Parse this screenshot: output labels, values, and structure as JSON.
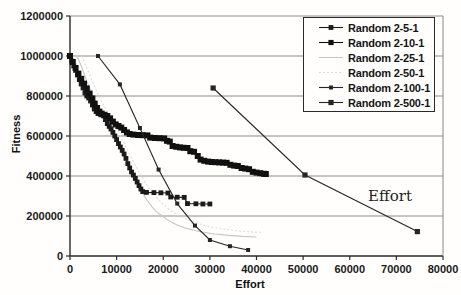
{
  "chart_data": {
    "type": "line",
    "title": "",
    "x_axis": {
      "title": "Effort",
      "min": 0,
      "max": 80000,
      "tick_values": [
        0,
        10000,
        20000,
        30000,
        40000,
        50000,
        60000,
        70000,
        80000
      ],
      "tick_labels": [
        "0",
        "10000",
        "20000",
        "30000",
        "40000",
        "50000",
        "60000",
        "70000",
        "80000"
      ]
    },
    "y_axis": {
      "title": "Fitness",
      "min": 0,
      "max": 1200000,
      "tick_values": [
        0,
        200000,
        400000,
        600000,
        800000,
        1000000,
        1200000
      ],
      "tick_labels": [
        "0",
        "200000",
        "400000",
        "600000",
        "800000",
        "1000000",
        "1200000"
      ]
    },
    "grid": "horizontal",
    "legend_position": "top-right-inside",
    "annotations": [
      {
        "text": "Effort",
        "x": 67500,
        "y": 300000
      }
    ],
    "colors": {
      "axis": "#2a2a2a",
      "grid": "#8a8a8a",
      "black_series": "#1a1a1a",
      "gray_series": "#c6c6c6",
      "light_gray_series": "#dcdcdc"
    },
    "series": [
      {
        "name": "Random 2-5-1",
        "color": "#1a1a1a",
        "marker": "square",
        "marker_size": 2.4,
        "dash": "",
        "z": 3,
        "points": [
          [
            0,
            1000000
          ],
          [
            400,
            975000
          ],
          [
            800,
            950000
          ],
          [
            1200,
            928000
          ],
          [
            1600,
            905000
          ],
          [
            2000,
            882000
          ],
          [
            2400,
            860000
          ],
          [
            2800,
            840000
          ],
          [
            3200,
            815000
          ],
          [
            3600,
            800000
          ],
          [
            4000,
            790000
          ],
          [
            4400,
            775000
          ],
          [
            4800,
            755000
          ],
          [
            5200,
            735000
          ],
          [
            5600,
            722000
          ],
          [
            6000,
            712000
          ],
          [
            6600,
            706000
          ],
          [
            7200,
            700000
          ],
          [
            7600,
            682000
          ],
          [
            8000,
            662000
          ],
          [
            8400,
            648000
          ],
          [
            8800,
            635000
          ],
          [
            9200,
            618000
          ],
          [
            9600,
            600000
          ],
          [
            10000,
            582000
          ],
          [
            10400,
            562000
          ],
          [
            10800,
            545000
          ],
          [
            11200,
            528000
          ],
          [
            11600,
            510000
          ],
          [
            12000,
            488000
          ],
          [
            12400,
            462000
          ],
          [
            12800,
            440000
          ],
          [
            13200,
            420000
          ],
          [
            13600,
            405000
          ],
          [
            14000,
            388000
          ],
          [
            14400,
            370000
          ],
          [
            14800,
            352000
          ],
          [
            15200,
            335000
          ],
          [
            15600,
            322000
          ],
          [
            16400,
            318000
          ],
          [
            18000,
            317000
          ],
          [
            19500,
            316000
          ],
          [
            21000,
            315000
          ],
          [
            21600,
            295000
          ],
          [
            23000,
            294000
          ],
          [
            24500,
            293000
          ],
          [
            25200,
            262000
          ],
          [
            27000,
            261000
          ],
          [
            28500,
            260000
          ],
          [
            30000,
            260000
          ]
        ]
      },
      {
        "name": "Random 2-10-1",
        "color": "#111111",
        "marker": "square",
        "marker_size": 3.0,
        "dash": "",
        "z": 4,
        "points": [
          [
            0,
            1000000
          ],
          [
            600,
            970000
          ],
          [
            1200,
            940000
          ],
          [
            1800,
            912000
          ],
          [
            2400,
            886000
          ],
          [
            3000,
            862000
          ],
          [
            3600,
            838000
          ],
          [
            4200,
            812000
          ],
          [
            4800,
            788000
          ],
          [
            5300,
            762000
          ],
          [
            5800,
            740000
          ],
          [
            6300,
            722000
          ],
          [
            6800,
            712000
          ],
          [
            7400,
            706000
          ],
          [
            8000,
            700000
          ],
          [
            8600,
            688000
          ],
          [
            9200,
            672000
          ],
          [
            9800,
            658000
          ],
          [
            10400,
            650000
          ],
          [
            11000,
            642000
          ],
          [
            11600,
            630000
          ],
          [
            12200,
            618000
          ],
          [
            12800,
            610000
          ],
          [
            13600,
            607000
          ],
          [
            14600,
            605000
          ],
          [
            15600,
            604000
          ],
          [
            16600,
            603000
          ],
          [
            17200,
            592000
          ],
          [
            18200,
            590000
          ],
          [
            19200,
            589000
          ],
          [
            20200,
            588000
          ],
          [
            20800,
            576000
          ],
          [
            21400,
            572000
          ],
          [
            22000,
            550000
          ],
          [
            22800,
            546000
          ],
          [
            23600,
            543000
          ],
          [
            24400,
            541000
          ],
          [
            25200,
            540000
          ],
          [
            25800,
            524000
          ],
          [
            26600,
            521000
          ],
          [
            27400,
            500000
          ],
          [
            28000,
            482000
          ],
          [
            28800,
            476000
          ],
          [
            29600,
            472000
          ],
          [
            30400,
            470000
          ],
          [
            31200,
            469000
          ],
          [
            32000,
            468000
          ],
          [
            32800,
            467000
          ],
          [
            33600,
            466000
          ],
          [
            34400,
            456000
          ],
          [
            35200,
            452000
          ],
          [
            36000,
            450000
          ],
          [
            36800,
            440000
          ],
          [
            37600,
            437000
          ],
          [
            38400,
            434000
          ],
          [
            39200,
            421000
          ],
          [
            40000,
            417000
          ],
          [
            40800,
            414000
          ],
          [
            41600,
            411000
          ],
          [
            42000,
            410000
          ]
        ]
      },
      {
        "name": "Random 2-25-1",
        "color": "#c6c6c6",
        "marker": "none",
        "marker_size": 0,
        "dash": "",
        "z": 1,
        "points": [
          [
            1500,
            1000000
          ],
          [
            2500,
            945000
          ],
          [
            3500,
            880000
          ],
          [
            4500,
            825000
          ],
          [
            5500,
            770000
          ],
          [
            6500,
            726000
          ],
          [
            7500,
            705000
          ],
          [
            8500,
            668000
          ],
          [
            9500,
            620000
          ],
          [
            10500,
            565000
          ],
          [
            11500,
            505000
          ],
          [
            12500,
            462000
          ],
          [
            13500,
            410000
          ],
          [
            14500,
            360000
          ],
          [
            15500,
            318000
          ],
          [
            16500,
            280000
          ],
          [
            17500,
            248000
          ],
          [
            18500,
            222000
          ],
          [
            20000,
            196000
          ],
          [
            21500,
            172000
          ],
          [
            23000,
            155000
          ],
          [
            25000,
            138000
          ],
          [
            27000,
            126000
          ],
          [
            29000,
            117000
          ],
          [
            31000,
            110000
          ],
          [
            34000,
            103000
          ],
          [
            37000,
            98000
          ],
          [
            40000,
            95000
          ]
        ]
      },
      {
        "name": "Random 2-50-1",
        "color": "#dcdcdc",
        "marker": "none",
        "marker_size": 0,
        "dash": "2,2",
        "z": 2,
        "points": [
          [
            2500,
            1000000
          ],
          [
            3800,
            930000
          ],
          [
            5000,
            862000
          ],
          [
            6200,
            800000
          ],
          [
            7400,
            745000
          ],
          [
            8600,
            700000
          ],
          [
            9800,
            648000
          ],
          [
            11000,
            590000
          ],
          [
            12200,
            535000
          ],
          [
            13400,
            480000
          ],
          [
            14600,
            428000
          ],
          [
            15800,
            380000
          ],
          [
            17000,
            336000
          ],
          [
            18400,
            296000
          ],
          [
            19800,
            262000
          ],
          [
            21200,
            234000
          ],
          [
            23000,
            206000
          ],
          [
            25000,
            184000
          ],
          [
            27000,
            166000
          ],
          [
            29000,
            152000
          ],
          [
            31000,
            142000
          ],
          [
            33500,
            133000
          ],
          [
            36000,
            126000
          ],
          [
            38500,
            121000
          ],
          [
            41000,
            118000
          ]
        ]
      },
      {
        "name": "Random 2-100-1",
        "color": "#262626",
        "marker": "square",
        "marker_size": 2.0,
        "dash": "",
        "z": 5,
        "points": [
          [
            6000,
            1000000
          ],
          [
            10700,
            858000
          ],
          [
            15000,
            640000
          ],
          [
            19000,
            432000
          ],
          [
            23000,
            262000
          ],
          [
            26800,
            152000
          ],
          [
            30000,
            80000
          ],
          [
            34300,
            49000
          ],
          [
            38200,
            30000
          ]
        ]
      },
      {
        "name": "Random 2-500-1",
        "color": "#262626",
        "marker": "square",
        "marker_size": 2.6,
        "dash": "",
        "z": 6,
        "points": [
          [
            30700,
            840000
          ],
          [
            50400,
            405000
          ],
          [
            74500,
            122000
          ]
        ]
      }
    ]
  }
}
